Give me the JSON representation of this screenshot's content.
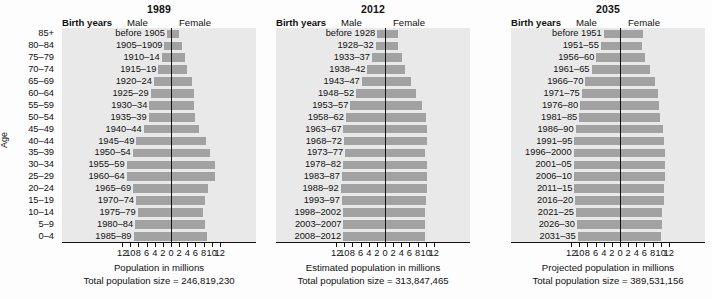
{
  "figure": {
    "age_axis_title": "Age",
    "age_groups": [
      "85+",
      "80–84",
      "75–79",
      "70–74",
      "65–69",
      "60–64",
      "55–59",
      "50–54",
      "45–49",
      "40–44",
      "35–39",
      "30–34",
      "25–29",
      "20–24",
      "15–19",
      "10–14",
      "5–9",
      "0–4"
    ],
    "colors": {
      "bar": "#a2a2a2",
      "plot_background": "#e9e9e9",
      "axis": "#111111",
      "page_background": "#fdfdfd"
    },
    "axis_tick_labels": [
      "12",
      "10",
      "8",
      "6",
      "4",
      "2",
      "0",
      "2",
      "4",
      "6",
      "8",
      "10",
      "12"
    ],
    "header_male": "Male",
    "header_female": "Female",
    "header_birth_years": "Birth years"
  },
  "chart_data": [
    {
      "type": "bar",
      "title": "1989",
      "xlabel": "Population in millions",
      "subtitle": "Total population size = 246,819,230",
      "ylabel": "Age",
      "xlim": [
        -12,
        12
      ],
      "grid": false,
      "legend": [
        "Male",
        "Female"
      ],
      "categories": [
        "85+",
        "80–84",
        "75–79",
        "70–74",
        "65–69",
        "60–64",
        "55–59",
        "50–54",
        "45–49",
        "40–44",
        "35–39",
        "30–34",
        "25–29",
        "20–24",
        "15–19",
        "10–14",
        "5–9",
        "0–4"
      ],
      "birth_years": [
        "before 1905",
        "1905–1909",
        "1910–14",
        "1915–19",
        "1920–24",
        "1925–29",
        "1930–34",
        "1935–39",
        "1940–44",
        "1945–49",
        "1950–54",
        "1955–59",
        "1960–64",
        "1965–69",
        "1970–74",
        "1975–79",
        "1980–84",
        "1985–89"
      ],
      "series": [
        {
          "name": "Male",
          "values": [
            1.0,
            1.6,
            2.3,
            3.1,
            4.2,
            5.0,
            5.3,
            5.5,
            6.7,
            8.5,
            9.4,
            10.9,
            10.9,
            9.3,
            8.6,
            8.2,
            8.8,
            9.2
          ]
        },
        {
          "name": "Female",
          "values": [
            2.0,
            2.6,
            3.4,
            4.0,
            5.1,
            5.7,
            5.7,
            5.8,
            6.9,
            8.6,
            9.5,
            10.9,
            10.9,
            9.2,
            8.4,
            7.9,
            8.4,
            8.8
          ]
        }
      ]
    },
    {
      "type": "bar",
      "title": "2012",
      "xlabel": "Estimated population in millions",
      "subtitle": "Total population size = 313,847,465",
      "ylabel": "Age",
      "xlim": [
        -12,
        12
      ],
      "grid": false,
      "legend": [
        "Male",
        "Female"
      ],
      "categories": [
        "85+",
        "80–84",
        "75–79",
        "70–74",
        "65–69",
        "60–64",
        "55–59",
        "50–54",
        "45–49",
        "40–44",
        "35–39",
        "30–34",
        "25–29",
        "20–24",
        "15–19",
        "10–14",
        "5–9",
        "0–4"
      ],
      "birth_years": [
        "before 1928",
        "1928–32",
        "1933–37",
        "1938–42",
        "1943–47",
        "1948–52",
        "1953–57",
        "1958–62",
        "1963–67",
        "1968–72",
        "1973–77",
        "1978–82",
        "1983–87",
        "1988–92",
        "1993–97",
        "1998–2002",
        "2003–2007",
        "2008–2012"
      ],
      "series": [
        {
          "name": "Male",
          "values": [
            1.9,
            2.3,
            3.2,
            4.3,
            5.7,
            7.1,
            8.5,
            9.6,
            10.2,
            10.1,
            9.8,
            10.3,
            10.6,
            10.9,
            10.6,
            10.3,
            10.2,
            10.3
          ]
        },
        {
          "name": "Female",
          "values": [
            3.2,
            3.3,
            4.1,
            5.0,
            6.4,
            7.7,
            9.0,
            10.0,
            10.4,
            10.2,
            9.9,
            10.2,
            10.3,
            10.4,
            10.1,
            9.9,
            9.8,
            9.9
          ]
        }
      ]
    },
    {
      "type": "bar",
      "title": "2035",
      "xlabel": "Projected population in millions",
      "subtitle": "Total population size = 389,531,156",
      "ylabel": "Age",
      "xlim": [
        -12,
        12
      ],
      "grid": false,
      "legend": [
        "Male",
        "Female"
      ],
      "categories": [
        "85+",
        "80–84",
        "75–79",
        "70–74",
        "65–69",
        "60–64",
        "55–59",
        "50–54",
        "45–49",
        "40–44",
        "35–39",
        "30–34",
        "25–29",
        "20–24",
        "15–19",
        "10–14",
        "5–9",
        "0–4"
      ],
      "birth_years": [
        "before 1951",
        "1951–55",
        "1956–60",
        "1961–65",
        "1966–70",
        "1971–75",
        "1976–80",
        "1981–85",
        "1986–90",
        "1991–95",
        "1996–2000",
        "2001–05",
        "2006–10",
        "2011–15",
        "2016–20",
        "2021–25",
        "2026–30",
        "2031–35"
      ],
      "series": [
        {
          "name": "Male",
          "values": [
            4.0,
            4.7,
            5.8,
            7.0,
            8.5,
            9.4,
            9.8,
            10.0,
            10.9,
            11.2,
            11.4,
            11.4,
            11.3,
            11.2,
            11.0,
            10.8,
            10.6,
            10.4
          ]
        },
        {
          "name": "Female",
          "values": [
            5.6,
            5.5,
            6.2,
            7.3,
            8.6,
            9.3,
            9.6,
            9.8,
            10.6,
            10.9,
            11.1,
            11.1,
            11.0,
            10.9,
            10.7,
            10.4,
            10.2,
            10.0
          ]
        }
      ]
    }
  ]
}
